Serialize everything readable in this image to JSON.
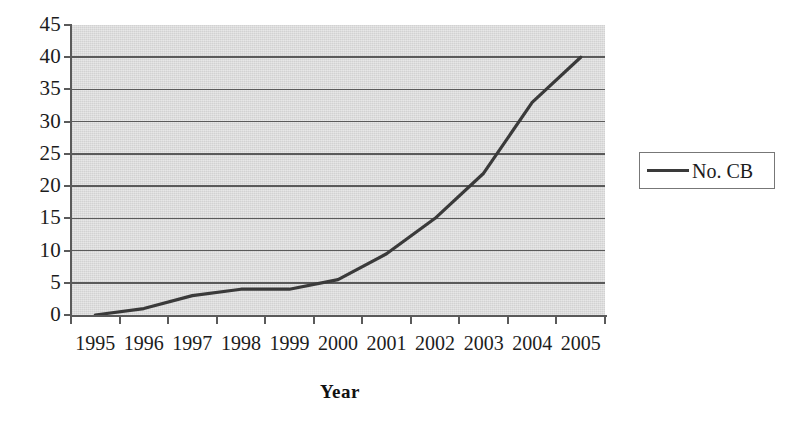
{
  "chart_data": {
    "type": "line",
    "title": "",
    "xlabel": "Year",
    "ylabel": "",
    "categories": [
      "1995",
      "1996",
      "1997",
      "1998",
      "1999",
      "2000",
      "2001",
      "2002",
      "2003",
      "2004",
      "2005"
    ],
    "series": [
      {
        "name": "No. CB",
        "values": [
          0,
          1,
          3,
          4,
          4,
          5.5,
          9.5,
          15,
          22,
          33,
          40
        ],
        "color": "#3a3a3a"
      }
    ],
    "ylim": [
      0,
      45
    ],
    "y_ticks": [
      0,
      5,
      10,
      15,
      20,
      25,
      30,
      35,
      40,
      45
    ],
    "y_tick_labels": [
      "0",
      "5",
      "10",
      "15",
      "20",
      "25",
      "30",
      "35",
      "40",
      "45"
    ],
    "grid": true,
    "grid_axis": "y",
    "legend": {
      "position": "right",
      "entries": [
        {
          "label": "No. CB",
          "marker": "line-swatch"
        }
      ]
    },
    "plot_background_color": "#d2d2d2",
    "gridline_color": "#5a5a5a",
    "axis_color": "#5a5a5a",
    "canvas_background_color": "#ffffff"
  }
}
